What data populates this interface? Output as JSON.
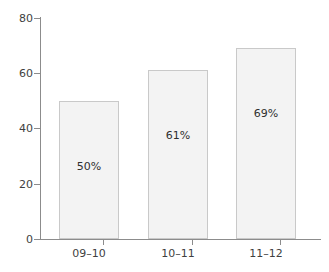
{
  "chart_data": {
    "type": "bar",
    "title": "",
    "subtitle": "",
    "xlabel": "",
    "ylabel": "",
    "categories": [
      "09–10",
      "10–11",
      "11–12"
    ],
    "values": [
      50,
      61,
      69
    ],
    "data_labels": [
      "50%",
      "61%",
      "69%"
    ],
    "ylim": [
      0,
      80
    ],
    "yticks": [
      0,
      20,
      40,
      60,
      80
    ],
    "ytick_labels": [
      "0",
      "20",
      "40",
      "60",
      "80"
    ],
    "grid": false,
    "legend": null,
    "legend_position": "none",
    "annotations": []
  },
  "style": {
    "bar_fill": "#f3f3f3",
    "bar_border": "#c9c9c9",
    "axis_color": "#8c8c8c",
    "text_color": "#3f3f3f",
    "background": "#ffffff"
  }
}
